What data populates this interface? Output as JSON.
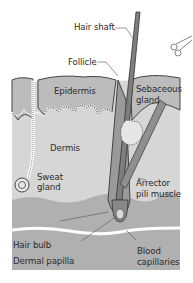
{
  "diagram": {
    "labels": {
      "hair_shaft": "Hair shaft",
      "follicle": "Follicle",
      "epidermis": "Epidermis",
      "sebaceous_gland_1": "Sebaceous",
      "sebaceous_gland_2": "gland",
      "dermis": "Dermis",
      "sweat_gland_1": "Sweat",
      "sweat_gland_2": "gland",
      "arrector_1": "Arrector",
      "arrector_2": "pili muscle",
      "hair_bulb": "Hair bulb",
      "dermal_papilla": "Dermal papilla",
      "blood_capillaries_1": "Blood",
      "blood_capillaries_2": "capillaries"
    },
    "icons": {
      "corner": "scissors-icon"
    },
    "colors": {
      "epidermis": "#b9b9b9",
      "dermis": "#d4d4d4",
      "hypodermis": "#a8a8a8",
      "hair": "#8a8a8a",
      "outline": "#555555",
      "text": "#2b2b2b"
    }
  }
}
